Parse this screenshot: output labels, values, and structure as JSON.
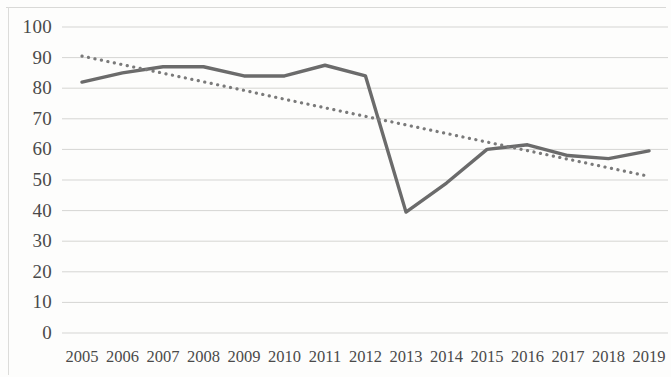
{
  "chart_data": {
    "type": "line",
    "title": "",
    "subtitle": "",
    "xlabel": "",
    "ylabel": "",
    "categories": [
      "2005",
      "2006",
      "2007",
      "2008",
      "2009",
      "2010",
      "2011",
      "2012",
      "2013",
      "2014",
      "2015",
      "2016",
      "2017",
      "2018",
      "2019"
    ],
    "ylim": [
      0,
      100
    ],
    "ytick_labels": [
      "100",
      "90",
      "80",
      "70",
      "60",
      "50",
      "40",
      "30",
      "20",
      "10",
      "0"
    ],
    "ytick_values": [
      100,
      90,
      80,
      70,
      60,
      50,
      40,
      30,
      20,
      10,
      0
    ],
    "grid": true,
    "grid_axis": "y",
    "legend": "none",
    "series": [
      {
        "name": "data-series",
        "style": "solid",
        "color": "#6b6b6b",
        "values": [
          82,
          85,
          87,
          87,
          84,
          84,
          87.5,
          84,
          39.5,
          49,
          60,
          61.5,
          58,
          57,
          59.5
        ]
      },
      {
        "name": "linear-trendline",
        "style": "dotted",
        "color": "#7a7a7a",
        "values": [
          90.5,
          87.7,
          84.9,
          82.1,
          79.3,
          76.4,
          73.6,
          70.8,
          68.0,
          65.2,
          62.4,
          59.6,
          56.8,
          54.0,
          51.2
        ]
      }
    ],
    "colors": {
      "series_line": "#6b6b6b",
      "trendline": "#7a7a7a",
      "gridline": "#d5d5d3",
      "axis_text": "#4a4a4a",
      "background": "#fdfdfc"
    }
  }
}
